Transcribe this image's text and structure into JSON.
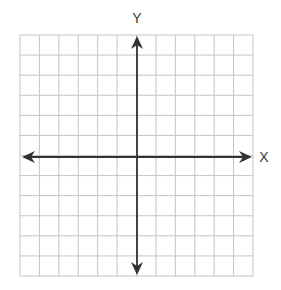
{
  "diagram": {
    "type": "coordinate-plane",
    "grid": {
      "columns": 12,
      "rows": 12,
      "left": 20,
      "top": 35,
      "right": 253,
      "bottom": 276,
      "line_color": "#c4c4c4"
    },
    "axes": {
      "origin_x": 137,
      "origin_y": 157,
      "color": "#333333",
      "x_label": "X",
      "y_label": "Y",
      "x_arrow_left": 22,
      "x_arrow_right": 252,
      "y_arrow_top": 36,
      "y_arrow_bottom": 275
    }
  }
}
